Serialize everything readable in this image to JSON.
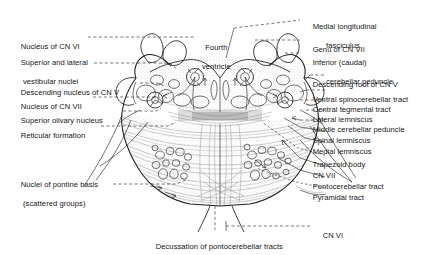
{
  "figure": {
    "domain_note": "anatomical line drawing with leader-line labels",
    "center_label": {
      "line1": "Fourth",
      "line2": "ventricle"
    },
    "bottom_labels": {
      "cn6": "CN VI",
      "decussation": "Decussation of pontocerebellar tracts"
    },
    "left_labels": [
      {
        "id": "nucleus-cn-vi",
        "line1": "Nucleus of CN VI",
        "line2": ""
      },
      {
        "id": "superior-lateral-vestibular-nuclei",
        "line1": "Superior and lateral",
        "line2": "vestibular nuclei"
      },
      {
        "id": "descending-nucleus-cn-v",
        "line1": "Descending nucleus of CN V",
        "line2": ""
      },
      {
        "id": "nucleus-cn-vii",
        "line1": "Nucleus of CN VII",
        "line2": ""
      },
      {
        "id": "superior-olivary-nucleus",
        "line1": "Superior olivary nucleus",
        "line2": ""
      },
      {
        "id": "reticular-formation",
        "line1": "Reticular formation",
        "line2": ""
      },
      {
        "id": "nuclei-pontine-basis",
        "line1": "Nuclei of pontine basis",
        "line2": "(scattered groups)"
      }
    ],
    "right_labels": [
      {
        "id": "medial-longitudinal-fasciculus",
        "line1": "Medial longitudinal",
        "line2": "fasciculus"
      },
      {
        "id": "genu-cn-vii",
        "line1": "Genu of CN VII",
        "line2": ""
      },
      {
        "id": "inferior-cerebellar-peduncle",
        "line1": "Inferior (caudal)",
        "line2": "cerebellar peduncle"
      },
      {
        "id": "descending-root-cn-v",
        "line1": "Descending root of CN V",
        "line2": ""
      },
      {
        "id": "ventral-spinocerebellar-tract",
        "line1": "Ventral spinocerebellar tract",
        "line2": ""
      },
      {
        "id": "central-tegmental-tract",
        "line1": "Central tegmental tract",
        "line2": ""
      },
      {
        "id": "lateral-lemniscus",
        "line1": "Lateral lemniscus",
        "line2": ""
      },
      {
        "id": "middle-cerebellar-peduncle",
        "line1": "Middle cerebellar peduncle",
        "line2": ""
      },
      {
        "id": "spinal-lemniscus",
        "line1": "Spinal lemniscus",
        "line2": ""
      },
      {
        "id": "medial-lemniscus",
        "line1": "Medial lemniscus",
        "line2": ""
      },
      {
        "id": "trapezoid-body",
        "line1": "Trapezoid body",
        "line2": ""
      },
      {
        "id": "cn-vii",
        "line1": "CN VII",
        "line2": ""
      },
      {
        "id": "pontocerebellar-tract",
        "line1": "Pontocerebellar tract",
        "line2": ""
      },
      {
        "id": "pyramidal-tract",
        "line1": "Pyramidal tract",
        "line2": ""
      }
    ],
    "colors": {
      "ink": "#1c1c1c",
      "fiber_gray": "#8d8d8d",
      "stipple_gray": "#b9b9b9",
      "background": "#ffffff"
    }
  }
}
